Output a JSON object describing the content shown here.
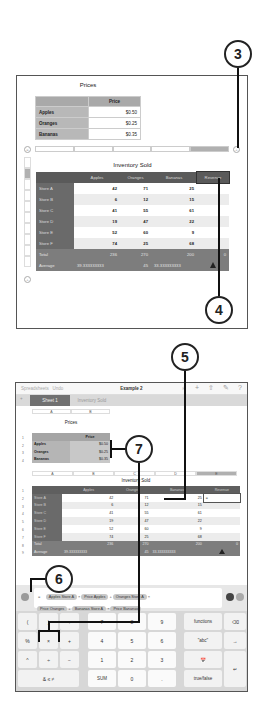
{
  "callouts": [
    {
      "num": "3"
    },
    {
      "num": "4"
    },
    {
      "num": "5"
    },
    {
      "num": "6"
    },
    {
      "num": "7"
    }
  ],
  "panel1": {
    "prices_title": "Prices",
    "prices_header": "Price",
    "prices_rows": [
      {
        "label": "Apples",
        "value": "$0.50"
      },
      {
        "label": "Oranges",
        "value": "$0.25"
      },
      {
        "label": "Bananas",
        "value": "$0.35"
      }
    ],
    "inventory_title": "Inventory Sold",
    "inventory_headers": [
      "",
      "Apples",
      "Oranges",
      "Bananas",
      "Revenue"
    ],
    "inventory_rows": [
      {
        "label": "Store A",
        "values": [
          "42",
          "71",
          "25",
          ""
        ]
      },
      {
        "label": "Store B",
        "values": [
          "6",
          "12",
          "15",
          ""
        ]
      },
      {
        "label": "Store C",
        "values": [
          "41",
          "55",
          "61",
          ""
        ]
      },
      {
        "label": "Store D",
        "values": [
          "19",
          "47",
          "22",
          ""
        ]
      },
      {
        "label": "Store E",
        "values": [
          "52",
          "60",
          "9",
          ""
        ]
      },
      {
        "label": "Store F",
        "values": [
          "74",
          "25",
          "68",
          ""
        ]
      }
    ],
    "total_row": {
      "label": "Total",
      "values": [
        "236",
        "270",
        "200",
        "0"
      ]
    },
    "average_row": {
      "label": "Average",
      "values": [
        "39.333333333",
        "45",
        "33.333333333",
        ""
      ]
    },
    "add_row_icon": "+",
    "add_col_icon": "+",
    "select_icon": "="
  },
  "panel2": {
    "toolbar": {
      "back_label": "Spreadsheets",
      "undo_label": "Undo",
      "title": "Example 2",
      "icons": [
        "brush-icon",
        "plus-icon",
        "share-icon",
        "wrench-icon",
        "help-icon"
      ]
    },
    "tabs": {
      "add": "+",
      "active": "Sheet 1",
      "inactive": "Inventory Sold"
    },
    "top_col_letters": [
      "A",
      "B"
    ],
    "prices_title": "Prices",
    "prices_header": "Price",
    "prices_rows": [
      {
        "num": "2",
        "label": "Apples",
        "value": "$0.50"
      },
      {
        "num": "3",
        "label": "Oranges",
        "value": "$0.25"
      },
      {
        "num": "4",
        "label": "Bananas",
        "value": "$0.35"
      }
    ],
    "mid_col_letters": [
      "A",
      "B",
      "C",
      "D",
      "E"
    ],
    "inventory_title": "Inventory Sold",
    "inventory_headers": [
      "",
      "Apples",
      "Oranges",
      "Bananas",
      "Revenue"
    ],
    "inventory_rows": [
      {
        "label": "Store A",
        "values": [
          "42",
          "71",
          "25",
          "="
        ]
      },
      {
        "label": "Store B",
        "values": [
          "6",
          "12",
          "15",
          ""
        ]
      },
      {
        "label": "Store C",
        "values": [
          "41",
          "55",
          "61",
          ""
        ]
      },
      {
        "label": "Store D",
        "values": [
          "19",
          "47",
          "22",
          ""
        ]
      },
      {
        "label": "Store E",
        "values": [
          "52",
          "60",
          "9",
          ""
        ]
      },
      {
        "label": "Store F",
        "values": [
          "74",
          "25",
          "68",
          ""
        ]
      }
    ],
    "total_row": {
      "label": "Total",
      "values": [
        "236",
        "270",
        "200",
        "0"
      ]
    },
    "average_row": {
      "label": "Average",
      "values": [
        "39.333333333",
        "45",
        "33.333333333",
        ""
      ]
    },
    "formula": {
      "equals": "=",
      "line1": [
        {
          "token": "Apples Store A"
        },
        {
          "op": "×"
        },
        {
          "token": "Price Apples"
        },
        {
          "op": "+"
        },
        {
          "token": "Oranges Store A"
        },
        {
          "op": "×"
        }
      ],
      "line2": [
        {
          "token": "Price Oranges"
        },
        {
          "op": "+"
        },
        {
          "token": "Bananas Store A"
        },
        {
          "op": "×"
        },
        {
          "token": "Price Bananas"
        }
      ]
    },
    "keypad": {
      "row1": [
        "(",
        ")",
        ":",
        "7",
        "8",
        "9",
        "functions",
        "⌫"
      ],
      "row2": [
        "%",
        "×",
        "+",
        "4",
        "5",
        "6",
        "\"abc\"",
        "→"
      ],
      "row3": [
        "^",
        "÷",
        "−",
        "1",
        "2",
        "3",
        "📅",
        ""
      ],
      "row4": [
        "& ≤ ≠",
        "SUM",
        "0",
        ".",
        "true/false",
        "↵"
      ]
    }
  }
}
